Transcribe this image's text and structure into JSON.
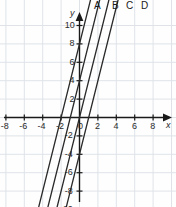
{
  "chart_data": {
    "type": "line",
    "title": "",
    "xlabel": "x",
    "ylabel": "y",
    "xlim": [
      -9,
      9
    ],
    "ylim": [
      -11,
      11
    ],
    "grid": true,
    "grid_step": 2,
    "legend_position": "top",
    "xticks": [
      "-8",
      "-6",
      "-4",
      "-2",
      "0",
      "2",
      "4",
      "6",
      "8"
    ],
    "xtick_values": [
      -8,
      -6,
      -4,
      -2,
      0,
      2,
      4,
      6,
      8
    ],
    "yticks": [
      "10",
      "8",
      "6",
      "4",
      "2",
      "-2",
      "-4",
      "-6",
      "-8",
      "-10"
    ],
    "ytick_values": [
      10,
      8,
      6,
      4,
      2,
      -2,
      -4,
      -6,
      -8,
      -10
    ],
    "series": [
      {
        "name": "A",
        "slope": 4,
        "intercept": 8,
        "x_intercept": -2,
        "label": "A"
      },
      {
        "name": "B",
        "slope": 4,
        "intercept": 4,
        "x_intercept": -1,
        "label": "B"
      },
      {
        "name": "C",
        "slope": 4,
        "intercept": 0,
        "x_intercept": 0,
        "label": "C"
      },
      {
        "name": "D",
        "slope": 4,
        "intercept": -4,
        "x_intercept": 1,
        "label": "D"
      }
    ],
    "annotations": [
      "A",
      "B",
      "C",
      "D"
    ]
  },
  "colors": {
    "line": "#2a2a2a",
    "axis": "#1a1a1a",
    "grid": "#dfe3e8",
    "text": "#2b2b2b",
    "background": "#fefefe"
  },
  "axis_labels": {
    "x": "x",
    "y": "y"
  }
}
